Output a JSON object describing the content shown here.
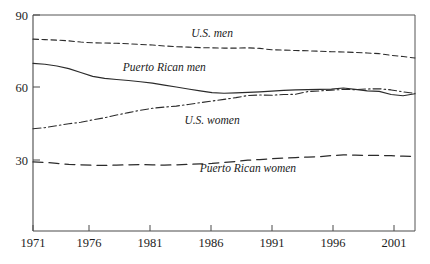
{
  "chart_data": {
    "type": "line",
    "title": "",
    "subtitle": "",
    "xlabel": "",
    "ylabel": "",
    "xlim": [
      1971,
      2003
    ],
    "ylim": [
      0,
      90
    ],
    "grid": false,
    "legend_position": "inline-labels",
    "x_ticks": [
      1971,
      1976,
      1981,
      1986,
      1991,
      1996,
      2001
    ],
    "x_tick_labels": [
      "1971",
      "1976",
      "1981",
      "1986",
      "1991",
      "1996",
      "2001"
    ],
    "y_ticks": [
      30,
      60,
      90
    ],
    "y_tick_labels": [
      "30",
      "60",
      "90"
    ],
    "x": [
      1971,
      1972,
      1973,
      1974,
      1975,
      1976,
      1977,
      1978,
      1979,
      1980,
      1981,
      1982,
      1983,
      1984,
      1985,
      1986,
      1987,
      1988,
      1989,
      1990,
      1991,
      1992,
      1993,
      1994,
      1995,
      1996,
      1997,
      1998,
      1999,
      2000,
      2001,
      2002,
      2003
    ],
    "series": [
      {
        "name": "U.S. men",
        "style": "dashed",
        "label_x": 1986,
        "label_y": 81,
        "values": [
          80.0,
          79.8,
          79.6,
          79.3,
          78.8,
          78.5,
          78.4,
          78.3,
          78.1,
          77.8,
          77.6,
          77.2,
          76.9,
          76.7,
          76.5,
          76.4,
          76.3,
          76.3,
          76.4,
          76.2,
          75.6,
          75.5,
          75.3,
          75.2,
          75.0,
          74.8,
          74.7,
          74.5,
          74.3,
          74.0,
          73.3,
          72.8,
          72.2
        ]
      },
      {
        "name": "Puerto Rican men",
        "style": "solid",
        "label_x": 1982,
        "label_y": 67,
        "values": [
          70.0,
          69.6,
          68.9,
          67.8,
          66.2,
          64.6,
          63.8,
          63.3,
          62.9,
          62.4,
          61.8,
          61.0,
          60.2,
          59.4,
          58.6,
          57.9,
          57.6,
          57.8,
          58.0,
          58.2,
          58.5,
          58.8,
          59.0,
          59.1,
          59.2,
          59.3,
          59.8,
          59.2,
          58.6,
          58.4,
          57.1,
          56.6,
          57.4
        ]
      },
      {
        "name": "U.S. women",
        "style": "dash-dot",
        "label_x": 1986,
        "label_y": 45,
        "values": [
          42.9,
          43.4,
          44.2,
          45.0,
          45.6,
          46.6,
          47.5,
          48.6,
          49.6,
          50.6,
          51.4,
          51.9,
          52.3,
          53.0,
          53.7,
          54.4,
          55.1,
          55.8,
          56.7,
          56.9,
          56.8,
          57.1,
          57.2,
          58.3,
          58.6,
          58.9,
          59.2,
          59.1,
          59.4,
          59.5,
          59.0,
          58.2,
          57.6
        ]
      },
      {
        "name": "Puerto Rican women",
        "style": "long-dashed",
        "label_x": 1989,
        "label_y": 25,
        "values": [
          29.2,
          29.0,
          28.6,
          28.2,
          28.0,
          27.8,
          27.8,
          27.9,
          28.0,
          28.1,
          28.0,
          27.9,
          28.0,
          28.2,
          28.4,
          28.6,
          29.0,
          29.4,
          29.9,
          30.2,
          30.5,
          30.8,
          31.0,
          31.2,
          31.4,
          31.8,
          32.1,
          32.0,
          31.9,
          31.9,
          31.8,
          31.6,
          31.5
        ]
      }
    ]
  },
  "labels": {
    "us_men": "U.S. men",
    "puerto_rican_men": "Puerto Rican men",
    "us_women": "U.S. women",
    "puerto_rican_women": "Puerto Rican women"
  },
  "y_axis": {
    "t90": "90",
    "t60": "60",
    "t30": "30"
  },
  "x_axis": {
    "t1971": "1971",
    "t1976": "1976",
    "t1981": "1981",
    "t1986": "1986",
    "t1991": "1991",
    "t1996": "1996",
    "t2001": "2001"
  }
}
